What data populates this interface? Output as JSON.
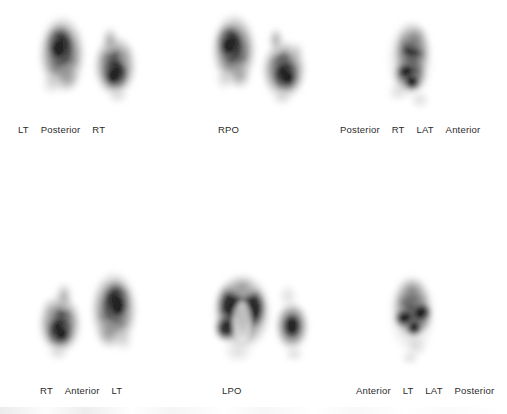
{
  "study": {
    "modality": "nuclear-medicine-lung-scintigraphy",
    "background_color": "#ffffff",
    "label_color": "#2b2b2b",
    "panel_count": 6,
    "rows": 2,
    "columns": 3
  },
  "panels": [
    {
      "id": "panel-posterior",
      "view": "posterior",
      "row": 0,
      "column": 0,
      "labels": [
        "LT",
        "Posterior",
        "RT"
      ]
    },
    {
      "id": "panel-rpo",
      "view": "right-posterior-oblique",
      "row": 0,
      "column": 1,
      "labels": [
        "RPO"
      ]
    },
    {
      "id": "panel-rt-lat",
      "view": "right-lateral",
      "row": 0,
      "column": 2,
      "labels": [
        "Posterior",
        "RT",
        "LAT",
        "Anterior"
      ]
    },
    {
      "id": "panel-anterior",
      "view": "anterior",
      "row": 1,
      "column": 0,
      "labels": [
        "RT",
        "Anterior",
        "LT"
      ]
    },
    {
      "id": "panel-lpo",
      "view": "left-posterior-oblique",
      "row": 1,
      "column": 1,
      "labels": [
        "LPO"
      ]
    },
    {
      "id": "panel-lt-lat",
      "view": "left-lateral",
      "row": 1,
      "column": 2,
      "labels": [
        "Anterior",
        "LT",
        "LAT",
        "Posterior"
      ]
    }
  ]
}
